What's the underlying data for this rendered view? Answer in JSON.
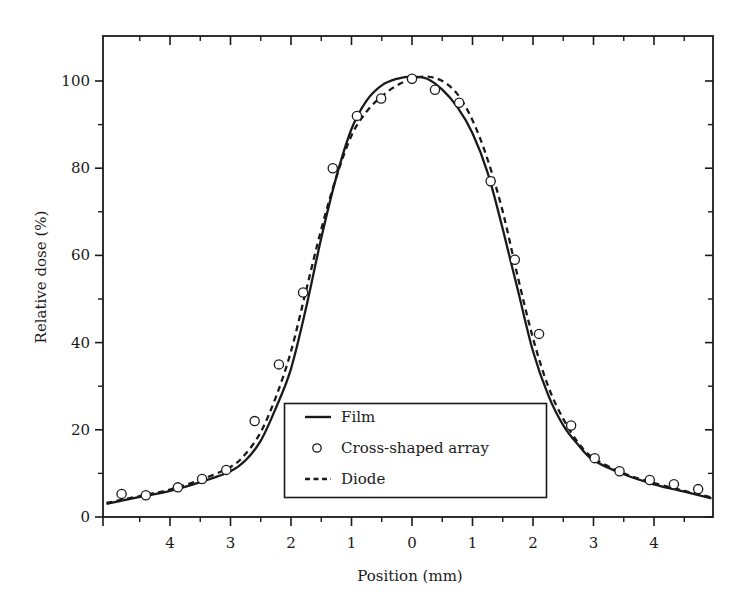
{
  "chart_data": {
    "type": "line",
    "title": "",
    "xlabel": "Position (mm)",
    "ylabel": "Relative dose (%)",
    "xlim": [
      -5.1,
      4.95
    ],
    "ylim": [
      0,
      110
    ],
    "grid": false,
    "legend_position": "lower center (inside plot)",
    "x_tick_values": [
      -4,
      -3,
      -2,
      -1,
      0,
      1,
      2,
      3,
      4
    ],
    "x_tick_labels": [
      "4",
      "3",
      "2",
      "1",
      "0",
      "1",
      "2",
      "3",
      "4"
    ],
    "x_minor_ticks": [
      -4.5,
      -3.5,
      -2.5,
      -1.5,
      -0.5,
      0.5,
      1.5,
      2.5,
      3.5,
      4.5
    ],
    "y_tick_values": [
      0,
      20,
      40,
      60,
      80,
      100
    ],
    "y_tick_labels": [
      "0",
      "20",
      "40",
      "60",
      "80",
      "100"
    ],
    "y_minor_ticks": [
      10,
      30,
      50,
      70,
      90
    ],
    "series": [
      {
        "name": "Film",
        "style": "solid",
        "x": [
          -5.05,
          -4.5,
          -4.0,
          -3.5,
          -3.0,
          -2.75,
          -2.5,
          -2.25,
          -2.0,
          -1.75,
          -1.5,
          -1.25,
          -1.0,
          -0.75,
          -0.5,
          -0.25,
          0.0,
          0.25,
          0.5,
          0.75,
          1.0,
          1.25,
          1.5,
          1.75,
          2.0,
          2.25,
          2.5,
          2.75,
          3.0,
          3.5,
          4.0,
          4.5,
          4.95
        ],
        "y": [
          3.0,
          4.6,
          6.0,
          8.0,
          10.5,
          13.0,
          17.5,
          25.0,
          34.0,
          48.0,
          64.0,
          78.0,
          89.0,
          95.5,
          99.0,
          100.5,
          101.0,
          100.5,
          98.0,
          94.0,
          88.0,
          79.0,
          66.0,
          52.0,
          38.0,
          28.0,
          21.0,
          16.5,
          13.0,
          9.8,
          7.5,
          5.8,
          4.3
        ]
      },
      {
        "name": "Cross-shaped array",
        "style": "open-circle",
        "x": [
          -4.8,
          -4.4,
          -3.87,
          -3.47,
          -3.07,
          -2.6,
          -2.2,
          -1.8,
          -1.31,
          -0.91,
          -0.51,
          0.0,
          0.38,
          0.78,
          1.3,
          1.7,
          2.1,
          2.63,
          3.02,
          3.43,
          3.93,
          4.33,
          4.73
        ],
        "y": [
          5.3,
          5.0,
          6.8,
          8.7,
          10.8,
          22.0,
          35.0,
          51.5,
          80.0,
          92.0,
          96.0,
          100.5,
          98.0,
          95.0,
          77.0,
          59.0,
          42.0,
          21.0,
          13.5,
          10.5,
          8.5,
          7.5,
          6.4
        ]
      },
      {
        "name": "Diode",
        "style": "dashed",
        "x": [
          -5.05,
          -4.5,
          -4.0,
          -3.5,
          -3.0,
          -2.75,
          -2.5,
          -2.25,
          -2.0,
          -1.75,
          -1.5,
          -1.25,
          -1.0,
          -0.75,
          -0.5,
          -0.25,
          0.0,
          0.25,
          0.5,
          0.75,
          1.0,
          1.25,
          1.5,
          1.75,
          2.0,
          2.25,
          2.5,
          2.75,
          3.0,
          3.5,
          4.0,
          4.5,
          4.95
        ],
        "y": [
          3.2,
          4.8,
          6.3,
          8.5,
          11.5,
          14.5,
          19.5,
          27.5,
          38.0,
          52.0,
          66.0,
          78.0,
          87.5,
          93.0,
          96.5,
          99.0,
          100.5,
          101.0,
          100.0,
          97.0,
          91.0,
          82.0,
          70.0,
          55.0,
          41.0,
          30.0,
          22.5,
          17.0,
          13.5,
          10.0,
          7.8,
          6.0,
          4.5
        ]
      }
    ],
    "legend": [
      {
        "label": "Film",
        "symbol": "solid-line"
      },
      {
        "label": "Cross-shaped array",
        "symbol": "open-circle"
      },
      {
        "label": "Diode",
        "symbol": "dashed-line"
      }
    ],
    "colors": {
      "line": "#1a1a1a",
      "marker_fill": "#ffffff",
      "background": "#ffffff"
    }
  }
}
